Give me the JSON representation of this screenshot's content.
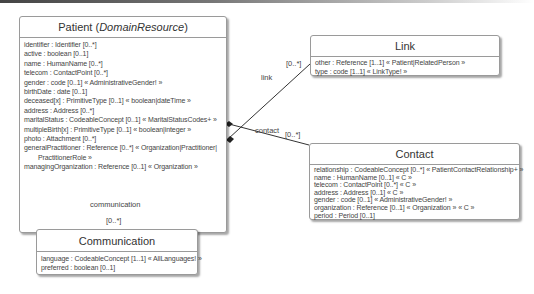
{
  "classes": {
    "patient": {
      "name": "Patient",
      "stereotype": "DomainResource",
      "attributes": [
        "identifier : Identifier [0..*]",
        "active : boolean [0..1]",
        "name : HumanName [0..*]",
        "telecom : ContactPoint [0..*]",
        "gender : code [0..1] « AdministrativeGender! »",
        "birthDate : date [0..1]",
        "deceased[x] : PrimitiveType [0..1] « boolean|dateTime »",
        "address : Address [0..*]",
        "maritalStatus : CodeableConcept [0..1] « MaritalStatusCodes+ »",
        "multipleBirth[x] : PrimitiveType [0..1] « boolean|integer »",
        "photo : Attachment [0..*]",
        "generalPractitioner : Reference [0..*] « Organization|Practitioner|",
        "PractitionerRole »",
        "managingOrganization : Reference [0..1] « Organization »"
      ]
    },
    "link": {
      "name": "Link",
      "attributes": [
        "other : Reference [1..1] « Patient|RelatedPerson »",
        "type : code [1..1] « LinkType! »"
      ]
    },
    "contact": {
      "name": "Contact",
      "attributes": [
        "relationship : CodeableConcept [0..*] « PatientContactRelationship+ »",
        "name : HumanName [0..1] « C »",
        "telecom : ContactPoint [0..*] « C »",
        "address : Address [0..1] « C »",
        "gender : code [0..1] « AdministrativeGender! »",
        "organization : Reference [0..1] « Organization » « C »",
        "period : Period [0..1]"
      ]
    },
    "communication": {
      "name": "Communication",
      "attributes": [
        "language : CodeableConcept [1..1] « AllLanguages! »",
        "preferred : boolean [0..1]"
      ]
    }
  },
  "associations": {
    "link": {
      "role": "link",
      "multiplicity": "[0..*]"
    },
    "contact": {
      "role": "contact",
      "multiplicity": "[0..*]"
    },
    "communication": {
      "role": "communication",
      "multiplicity": "[0..*]"
    }
  }
}
